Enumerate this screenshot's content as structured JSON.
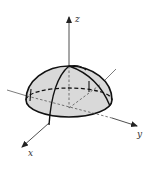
{
  "figure": {
    "axes": {
      "x_label": "x",
      "y_label": "y",
      "z_label": "z"
    },
    "colors": {
      "fill": "#d9d9d9",
      "stroke": "#111111",
      "axis": "#444444",
      "background": "#ffffff"
    }
  }
}
